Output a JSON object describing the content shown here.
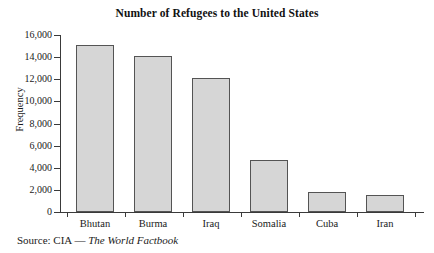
{
  "chart_data": {
    "type": "bar",
    "title": "Number of Refugees to the United States",
    "xlabel": "",
    "ylabel": "Frequency",
    "categories": [
      "Bhutan",
      "Burma",
      "Iraq",
      "Somalia",
      "Cuba",
      "Iran"
    ],
    "values": [
      15100,
      14100,
      12100,
      4700,
      1800,
      1550
    ],
    "ylim": [
      0,
      16000
    ],
    "yticks": [
      0,
      2000,
      4000,
      6000,
      8000,
      10000,
      12000,
      14000,
      16000
    ],
    "ytick_labels": [
      "0",
      "2,000",
      "4,000",
      "6,000",
      "8,000",
      "10,000",
      "12,000",
      "14,000",
      "16,000"
    ],
    "grid": false,
    "legend": "none",
    "bar_fill_color": "#d6d6d6",
    "bar_border_color": "#545454",
    "axis_color": "#3a3a3a"
  },
  "caption": {
    "source_prefix": "Source: CIA — ",
    "source_title": "The World Factbook"
  }
}
